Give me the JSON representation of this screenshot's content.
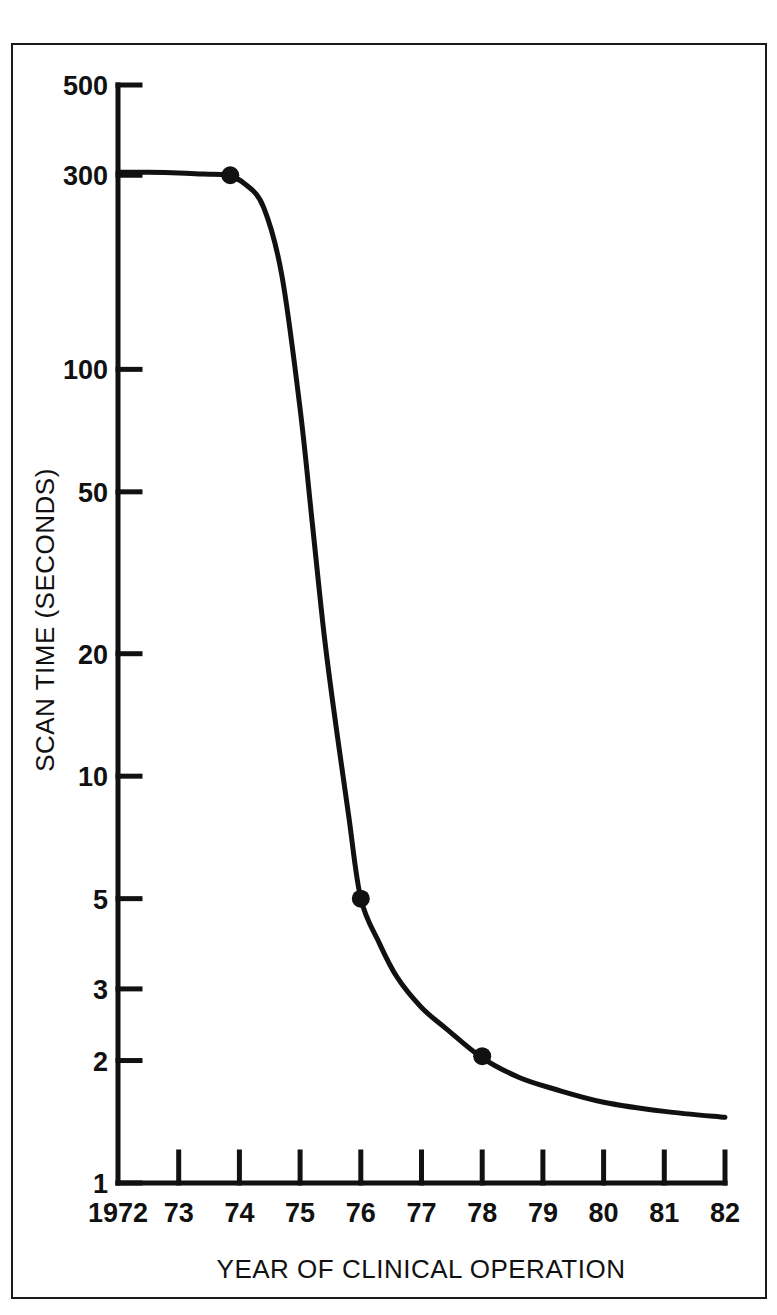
{
  "chart_data": {
    "type": "line",
    "title": "",
    "xlabel": "YEAR OF CLINICAL OPERATION",
    "ylabel": "SCAN TIME (SECONDS)",
    "yscale": "log",
    "ylim": [
      1,
      500
    ],
    "xlim": [
      1972,
      1982
    ],
    "grid": false,
    "legend": null,
    "y_tick_labels": [
      "500",
      "300",
      "100",
      "50",
      "20",
      "10",
      "5",
      "3",
      "2",
      "1"
    ],
    "y_tick_values": [
      500,
      300,
      100,
      50,
      20,
      10,
      5,
      3,
      2,
      1
    ],
    "x_tick_labels": [
      "1972",
      "73",
      "74",
      "75",
      "76",
      "77",
      "78",
      "79",
      "80",
      "81",
      "82"
    ],
    "x_tick_values": [
      1972,
      1973,
      1974,
      1975,
      1976,
      1977,
      1978,
      1979,
      1980,
      1981,
      1982
    ],
    "series": [
      {
        "name": "Scan time",
        "x": [
          1972.0,
          1972.5,
          1973.0,
          1973.4,
          1973.8,
          1974.1,
          1974.4,
          1974.7,
          1975.0,
          1975.2,
          1975.4,
          1975.6,
          1975.8,
          1976.0,
          1976.3,
          1976.6,
          1977.0,
          1977.4,
          1978.0,
          1978.6,
          1979.2,
          1980.0,
          1981.0,
          1982.0
        ],
        "y": [
          305,
          305,
          304,
          302,
          300,
          285,
          250,
          170,
          80,
          42,
          22,
          13,
          8.0,
          5.0,
          3.9,
          3.2,
          2.7,
          2.4,
          2.03,
          1.82,
          1.7,
          1.58,
          1.5,
          1.45
        ]
      }
    ],
    "markers": [
      {
        "x": 1973.85,
        "y": 300,
        "label": "1973.9, 300 s"
      },
      {
        "x": 1976.0,
        "y": 5.0,
        "label": "1976, 5 s"
      },
      {
        "x": 1978.0,
        "y": 2.05,
        "label": "1978, 2 s"
      }
    ],
    "colors": {
      "line": "#111111",
      "marker": "#111111",
      "axis": "#111111",
      "background": "#ffffff",
      "frame": "#1a1a1a"
    }
  }
}
